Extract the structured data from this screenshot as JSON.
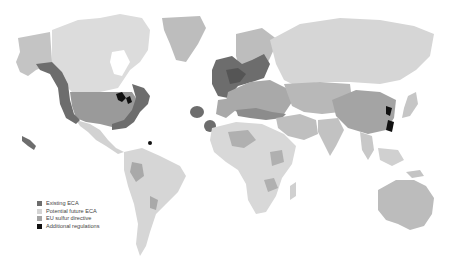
{
  "map": {
    "type": "world choropleth (grayscale)",
    "colors": {
      "background": "#ffffff",
      "other_land": "#e6e6e6",
      "potential_future_eca": "#d2d2d2",
      "eu_sulfur_directive": "#a9a9a9",
      "existing_eca": "#6d6d6d",
      "additional_regulations": "#111111",
      "us_mainland": "#9a9a9a",
      "greenland": "#bdbdbd",
      "australia": "#bcbcbc",
      "china": "#a4a4a4"
    }
  },
  "legend": {
    "items": [
      {
        "label": "Existing ECA",
        "color": "#6d6d6d"
      },
      {
        "label": "Potential future ECA",
        "color": "#d4d4d4"
      },
      {
        "label": "EU sulfur directive",
        "color": "#a3a3a3"
      },
      {
        "label": "Additional regulations",
        "color": "#111111"
      }
    ]
  }
}
